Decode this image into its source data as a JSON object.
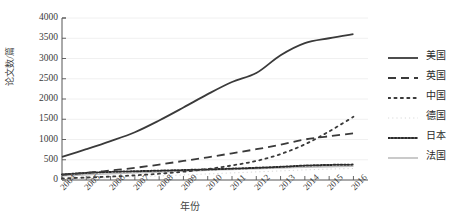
{
  "chart_data": {
    "type": "line",
    "title": "",
    "xlabel": "年份",
    "ylabel": "论文数/篇",
    "x": [
      2004,
      2005,
      2006,
      2007,
      2008,
      2009,
      2010,
      2011,
      2012,
      2013,
      2014,
      2015,
      2016
    ],
    "xtick_labels": [
      "2004",
      "2005",
      "2006",
      "2007",
      "2008",
      "2009",
      "2010",
      "2011",
      "2012",
      "2013",
      "2014",
      "2015",
      "2016"
    ],
    "ytick_labels": [
      "0",
      "500",
      "1000",
      "1500",
      "2000",
      "2500",
      "3000",
      "3500",
      "4000"
    ],
    "ylim": [
      0,
      4000
    ],
    "xlim": [
      2004,
      2016.6
    ],
    "ytick_step": 500,
    "grid": "horizontal",
    "legend_position": "right",
    "series": [
      {
        "name": "美国",
        "style": "solid",
        "color": "#3a3a3a",
        "width": 1.8,
        "values": [
          570,
          760,
          960,
          1180,
          1470,
          1790,
          2120,
          2420,
          2640,
          3080,
          3380,
          3500,
          3600
        ]
      },
      {
        "name": "英国",
        "style": "dashed",
        "color": "#3a3a3a",
        "width": 1.8,
        "values": [
          130,
          175,
          235,
          300,
          380,
          470,
          560,
          660,
          760,
          870,
          1000,
          1080,
          1150
        ]
      },
      {
        "name": "中国",
        "style": "sparse-dotted",
        "color": "#3a3a3a",
        "width": 1.8,
        "values": [
          40,
          60,
          85,
          115,
          155,
          205,
          270,
          360,
          470,
          640,
          880,
          1200,
          1560
        ]
      },
      {
        "name": "德国",
        "style": "faint-dotted",
        "color": "#d8d8d8",
        "width": 1.0,
        "values": [
          30,
          45,
          60,
          80,
          100,
          125,
          150,
          175,
          200,
          225,
          250,
          270,
          285
        ]
      },
      {
        "name": "日本",
        "style": "dotted",
        "color": "#2b2b2b",
        "width": 2.0,
        "values": [
          135,
          175,
          200,
          215,
          230,
          245,
          262,
          280,
          300,
          325,
          355,
          372,
          380
        ]
      },
      {
        "name": "法国",
        "style": "solid",
        "color": "#bdbdbd",
        "width": 1.6,
        "values": [
          105,
          130,
          155,
          178,
          200,
          222,
          243,
          262,
          280,
          298,
          316,
          330,
          340
        ]
      }
    ]
  },
  "axes": {
    "ylabel": "论文数/篇",
    "xlabel": "年份"
  }
}
